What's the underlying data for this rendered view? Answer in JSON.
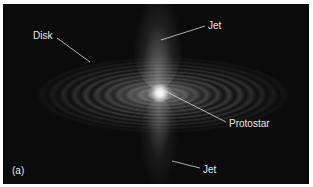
{
  "figure": {
    "panel_label": "(a)",
    "labels": {
      "disk": "Disk",
      "jet_top": "Jet",
      "protostar": "Protostar",
      "jet_bottom": "Jet"
    },
    "colors": {
      "background": "#0b0b0b",
      "label_text": "#e8e8e8",
      "leader_line": "#d8d8d8",
      "frame_border": "#ffffff"
    }
  }
}
